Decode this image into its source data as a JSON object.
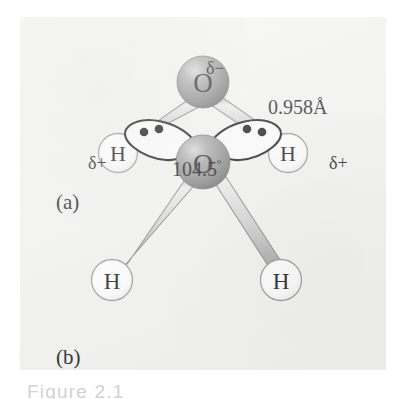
{
  "figure": {
    "caption": "Figure 2.1",
    "panels": [
      {
        "id": "a",
        "letter": "(a)",
        "name": "ball-and-stick water molecule with partial charges",
        "labels": {
          "delta_minus": "δ−",
          "delta_plus_left": "δ+",
          "delta_plus_right": "δ+",
          "bond_length": "0.958Å",
          "bond_angle_value": "104.5",
          "bond_angle_degree": "º"
        },
        "atoms": [
          {
            "element": "O",
            "role": "central-oxygen"
          },
          {
            "element": "H",
            "role": "hydrogen-left"
          },
          {
            "element": "H",
            "role": "hydrogen-right"
          }
        ]
      },
      {
        "id": "b",
        "letter": "(b)",
        "name": "water molecule with two lone pair orbitals",
        "atoms": [
          {
            "element": "O",
            "role": "central-oxygen"
          },
          {
            "element": "H",
            "role": "hydrogen-left"
          },
          {
            "element": "H",
            "role": "hydrogen-right"
          }
        ],
        "lone_pairs": [
          {
            "side": "left",
            "electrons": 2
          },
          {
            "side": "right",
            "electrons": 2
          }
        ]
      }
    ]
  },
  "colors": {
    "page_background": "#ffffff",
    "panel_background": "#f2f2f1",
    "oxygen_sphere": "#8e8e8e",
    "oxygen_sphere_highlight": "#d5d5d5",
    "hydrogen_sphere": "#fbfbfb",
    "hydrogen_outline": "#9a9a9a",
    "bond_fill": "#d7d7d7",
    "bond_outline": "#8a8a8a",
    "text": "#1a1a1a",
    "electron_dot": "#111111",
    "caption_text": "#d2d2d2"
  }
}
